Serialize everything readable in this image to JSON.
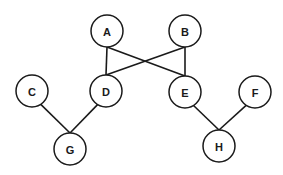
{
  "diagram": {
    "type": "graph",
    "node_radius": 16,
    "colors": {
      "stroke": "#1a1a1a",
      "fill": "#ffffff",
      "background": "#ffffff"
    },
    "nodes": [
      {
        "id": "A",
        "label": "A",
        "x": 107,
        "y": 31
      },
      {
        "id": "B",
        "label": "B",
        "x": 185,
        "y": 31
      },
      {
        "id": "C",
        "label": "C",
        "x": 32,
        "y": 91
      },
      {
        "id": "D",
        "label": "D",
        "x": 106,
        "y": 91
      },
      {
        "id": "E",
        "label": "E",
        "x": 185,
        "y": 92
      },
      {
        "id": "F",
        "label": "F",
        "x": 255,
        "y": 92
      },
      {
        "id": "G",
        "label": "G",
        "x": 70,
        "y": 149
      },
      {
        "id": "H",
        "label": "H",
        "x": 219,
        "y": 146
      }
    ],
    "edges": [
      {
        "from": "A",
        "to": "D"
      },
      {
        "from": "A",
        "to": "E"
      },
      {
        "from": "B",
        "to": "D"
      },
      {
        "from": "B",
        "to": "E"
      },
      {
        "from": "C",
        "to": "G"
      },
      {
        "from": "D",
        "to": "G"
      },
      {
        "from": "E",
        "to": "H"
      },
      {
        "from": "F",
        "to": "H"
      }
    ]
  }
}
